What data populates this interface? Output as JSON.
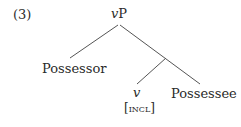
{
  "example": {
    "number": "(3)"
  },
  "tree": {
    "root": {
      "italic": "v",
      "rest": "P"
    },
    "left_leaf": "Possessor",
    "inner_head": {
      "label": "v",
      "feature": "[incl]"
    },
    "right_leaf": "Possessee"
  },
  "colors": {
    "text": "#2a2a2a",
    "lines": "#555555"
  }
}
